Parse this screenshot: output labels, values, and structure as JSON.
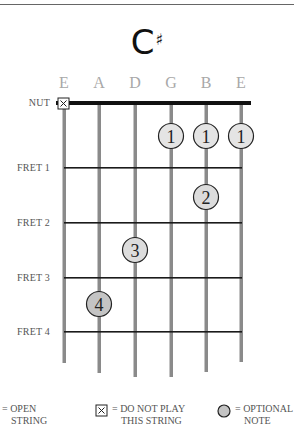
{
  "chord": {
    "root": "C",
    "accidental": "♯",
    "name": "C#"
  },
  "strings": [
    {
      "label": "E",
      "x": 64,
      "bottom": 363
    },
    {
      "label": "A",
      "x": 99,
      "bottom": 373
    },
    {
      "label": "D",
      "x": 135,
      "bottom": 377
    },
    {
      "label": "G",
      "x": 171,
      "bottom": 377
    },
    {
      "label": "B",
      "x": 206,
      "bottom": 372
    },
    {
      "label": "E",
      "x": 241,
      "bottom": 362
    }
  ],
  "side_labels": {
    "nut": "NUT",
    "fret1": "FRET 1",
    "fret2": "FRET 2",
    "fret3": "FRET 3",
    "fret4": "FRET 4"
  },
  "frets_y": [
    168,
    223,
    278,
    332
  ],
  "nut_y": 103,
  "muted_strings": [
    "E (6th)"
  ],
  "fingers": [
    {
      "finger": "1",
      "string": "G",
      "fret": 1,
      "optional": false
    },
    {
      "finger": "1",
      "string": "B",
      "fret": 1,
      "optional": false
    },
    {
      "finger": "1",
      "string": "E (1st)",
      "fret": 1,
      "optional": false
    },
    {
      "finger": "2",
      "string": "B",
      "fret": 2,
      "optional": false
    },
    {
      "finger": "3",
      "string": "D",
      "fret": 3,
      "optional": false
    },
    {
      "finger": "4",
      "string": "A",
      "fret": 4,
      "optional": true
    }
  ],
  "labels": {
    "f1a": "1",
    "f1b": "1",
    "f1c": "1",
    "f2": "2",
    "f3": "3",
    "f4": "4",
    "x": "X"
  },
  "legend": {
    "open_line1": "= OPEN",
    "open_line2": "STRING",
    "mute_line1": "= DO NOT PLAY",
    "mute_line2": "THIS STRING",
    "optional_line1": "= OPTIONAL",
    "optional_line2": "NOTE"
  },
  "colors": {
    "dot_fill": "#e4e4e4",
    "optional_fill": "#c4c4c4",
    "string": "#8a8a8a",
    "fret": "#1a1a1a",
    "nut": "#111111",
    "string_label": "#a8a8a8"
  }
}
